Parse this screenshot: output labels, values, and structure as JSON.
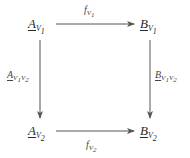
{
  "diagram": {
    "type": "commutative-square",
    "nodes": {
      "top_left": {
        "main": "A",
        "sub": "V",
        "sub_index": "1"
      },
      "top_right": {
        "main": "B",
        "sub": "V",
        "sub_index": "1"
      },
      "bottom_left": {
        "main": "A",
        "sub": "V",
        "sub_index": "2"
      },
      "bottom_right": {
        "main": "B",
        "sub": "V",
        "sub_index": "2"
      }
    },
    "arrows": {
      "top": {
        "label_main": "f",
        "label_sub": "V",
        "label_sub_index": "1",
        "from": "A_V1",
        "to": "B_V1"
      },
      "bottom": {
        "label_main": "f",
        "label_sub": "V",
        "label_sub_index": "2",
        "from": "A_V2",
        "to": "B_V2"
      },
      "left": {
        "label_main": "A",
        "label_sub": "V",
        "label_sub_index1": "1",
        "label_sub2": "V",
        "label_sub_index2": "2",
        "from": "A_V1",
        "to": "A_V2"
      },
      "right": {
        "label_main": "B",
        "label_sub": "V",
        "label_sub_index1": "1",
        "label_sub2": "V",
        "label_sub_index2": "2",
        "from": "B_V1",
        "to": "B_V2"
      }
    },
    "colors": {
      "line": "#555555",
      "text": "#2a2a2a"
    }
  }
}
